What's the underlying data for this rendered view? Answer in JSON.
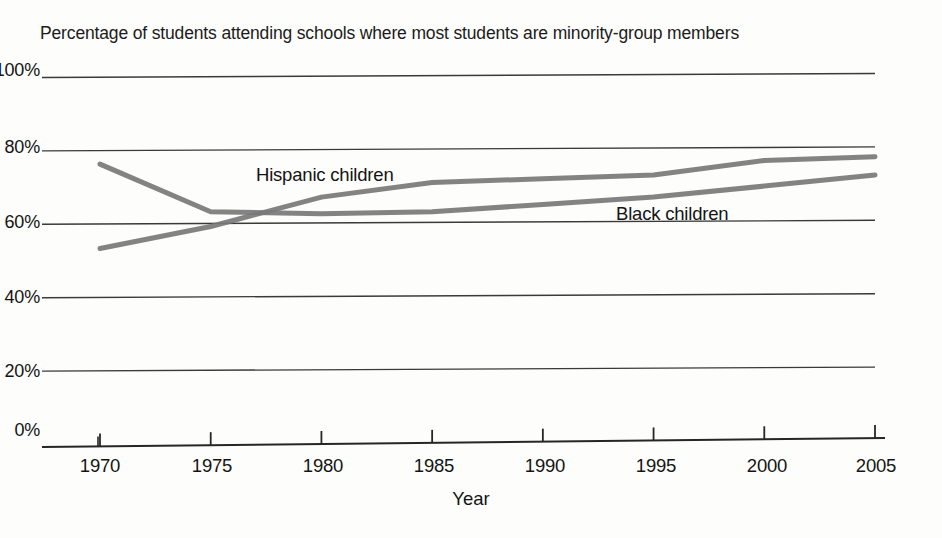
{
  "chart_data": {
    "type": "line",
    "title": "Percentage of students attending schools where most students are minority-group members",
    "xlabel": "Year",
    "ylabel": "",
    "x": [
      1970,
      1975,
      1980,
      1985,
      1990,
      1995,
      2000,
      2005
    ],
    "xlim": [
      1970,
      2005
    ],
    "ylim": [
      0,
      100
    ],
    "grid": true,
    "legend_position": "inline-annotations",
    "ytick_labels": [
      "0%",
      "20%",
      "40%",
      "60%",
      "80%",
      "100%"
    ],
    "ytick_values": [
      0,
      20,
      40,
      60,
      80,
      100
    ],
    "xtick_labels": [
      "1970",
      "1975",
      "1980",
      "1985",
      "1990",
      "1995",
      "2000",
      "2005"
    ],
    "series": [
      {
        "name": "Hispanic children",
        "color": "#787878",
        "values": [
          53,
          59,
          67,
          71,
          72,
          73,
          77,
          78
        ]
      },
      {
        "name": "Black children",
        "color": "#787878",
        "values": [
          76,
          63,
          62.5,
          63,
          65,
          67,
          70,
          73
        ]
      }
    ],
    "annotations": [
      {
        "text": "Hispanic children",
        "near_series": "Hispanic children"
      },
      {
        "text": "Black children",
        "near_series": "Black children"
      }
    ]
  },
  "axis": {
    "line_color": "#262626",
    "grid_color": "#3a3a3a"
  }
}
